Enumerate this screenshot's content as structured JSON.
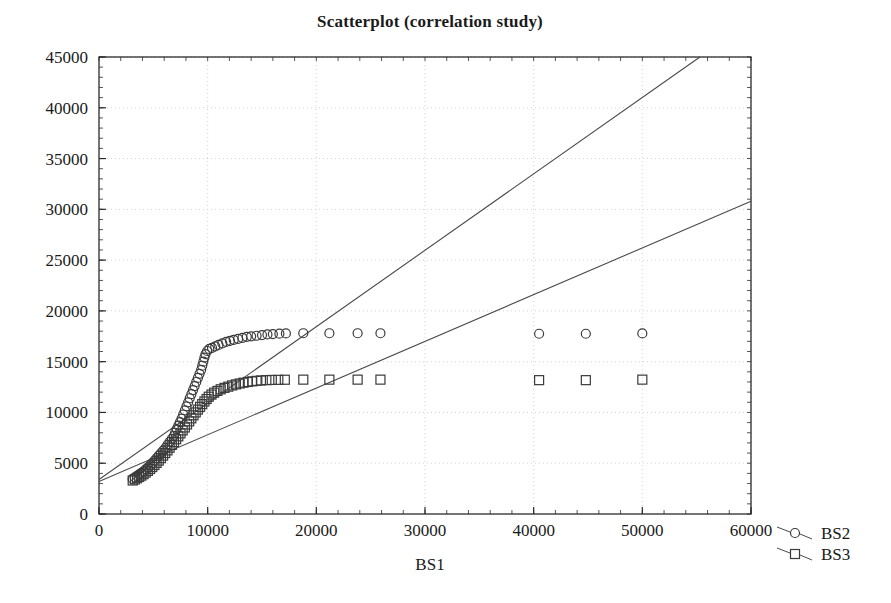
{
  "chart_data": {
    "type": "scatter",
    "title": "Scatterplot (correlation study)",
    "xlabel": "BS1",
    "ylabel": "",
    "xlim": [
      0,
      60000
    ],
    "ylim": [
      0,
      45000
    ],
    "xticks": [
      0,
      10000,
      20000,
      30000,
      40000,
      50000,
      60000
    ],
    "yticks": [
      0,
      5000,
      10000,
      15000,
      20000,
      25000,
      30000,
      35000,
      40000,
      45000
    ],
    "xtick_labels": [
      "0",
      "10000",
      "20000",
      "30000",
      "40000",
      "50000",
      "60000"
    ],
    "ytick_labels": [
      "0",
      "5000",
      "10000",
      "15000",
      "20000",
      "25000",
      "30000",
      "35000",
      "40000",
      "45000"
    ],
    "grid": true,
    "grid_style": "dotted",
    "legend_position": "outside-bottom-right",
    "minor_tick_step_x": 2000,
    "minor_tick_step_y": 1000,
    "marker_color": "#3a3a3a",
    "line_color": "#4a4a4a",
    "grid_color": "#c8c8cf",
    "axis_color": "#2b2b2b",
    "series": [
      {
        "name": "BS2",
        "marker": "circle",
        "points": [
          [
            3100,
            3450
          ],
          [
            3300,
            3600
          ],
          [
            3500,
            3750
          ],
          [
            3700,
            3900
          ],
          [
            3900,
            4050
          ],
          [
            4100,
            4200
          ],
          [
            4300,
            4400
          ],
          [
            4500,
            4600
          ],
          [
            4700,
            4800
          ],
          [
            4900,
            5000
          ],
          [
            5100,
            5250
          ],
          [
            5300,
            5500
          ],
          [
            5500,
            5750
          ],
          [
            5700,
            6000
          ],
          [
            5900,
            6250
          ],
          [
            6100,
            6500
          ],
          [
            6300,
            6800
          ],
          [
            6500,
            7100
          ],
          [
            6700,
            7400
          ],
          [
            6900,
            7700
          ],
          [
            7000,
            8000
          ],
          [
            7150,
            8350
          ],
          [
            7300,
            8700
          ],
          [
            7450,
            9050
          ],
          [
            7600,
            9400
          ],
          [
            7750,
            9800
          ],
          [
            7900,
            10200
          ],
          [
            8050,
            10600
          ],
          [
            8200,
            11000
          ],
          [
            8350,
            11400
          ],
          [
            8500,
            11800
          ],
          [
            8650,
            12200
          ],
          [
            8800,
            12600
          ],
          [
            8950,
            13000
          ],
          [
            9100,
            13400
          ],
          [
            9250,
            13800
          ],
          [
            9400,
            14200
          ],
          [
            9500,
            14600
          ],
          [
            9600,
            15000
          ],
          [
            9700,
            15400
          ],
          [
            9800,
            15750
          ],
          [
            9950,
            16050
          ],
          [
            10150,
            16250
          ],
          [
            10400,
            16350
          ],
          [
            10700,
            16500
          ],
          [
            11000,
            16650
          ],
          [
            11350,
            16800
          ],
          [
            11700,
            16950
          ],
          [
            12050,
            17050
          ],
          [
            12400,
            17150
          ],
          [
            12800,
            17250
          ],
          [
            13200,
            17350
          ],
          [
            13600,
            17450
          ],
          [
            14000,
            17500
          ],
          [
            14500,
            17550
          ],
          [
            15000,
            17620
          ],
          [
            15500,
            17680
          ],
          [
            16000,
            17720
          ],
          [
            16600,
            17760
          ],
          [
            17200,
            17780
          ],
          [
            18800,
            17800
          ],
          [
            21200,
            17800
          ],
          [
            23800,
            17800
          ],
          [
            25900,
            17800
          ],
          [
            40500,
            17750
          ],
          [
            44800,
            17750
          ],
          [
            50000,
            17780
          ]
        ]
      },
      {
        "name": "BS3",
        "marker": "square",
        "points": [
          [
            3100,
            3300
          ],
          [
            3300,
            3400
          ],
          [
            3500,
            3520
          ],
          [
            3700,
            3650
          ],
          [
            3900,
            3780
          ],
          [
            4100,
            3920
          ],
          [
            4300,
            4080
          ],
          [
            4500,
            4250
          ],
          [
            4700,
            4430
          ],
          [
            4900,
            4620
          ],
          [
            5100,
            4820
          ],
          [
            5300,
            5030
          ],
          [
            5500,
            5260
          ],
          [
            5700,
            5500
          ],
          [
            5900,
            5750
          ],
          [
            6100,
            6000
          ],
          [
            6300,
            6260
          ],
          [
            6500,
            6530
          ],
          [
            6700,
            6800
          ],
          [
            6900,
            7080
          ],
          [
            7100,
            7360
          ],
          [
            7300,
            7650
          ],
          [
            7500,
            7940
          ],
          [
            7700,
            8230
          ],
          [
            7900,
            8520
          ],
          [
            8100,
            8820
          ],
          [
            8300,
            9120
          ],
          [
            8500,
            9420
          ],
          [
            8700,
            9720
          ],
          [
            8900,
            10000
          ],
          [
            9100,
            10280
          ],
          [
            9300,
            10550
          ],
          [
            9500,
            10820
          ],
          [
            9700,
            11080
          ],
          [
            9900,
            11320
          ],
          [
            10100,
            11550
          ],
          [
            10350,
            11760
          ],
          [
            10600,
            11950
          ],
          [
            10900,
            12120
          ],
          [
            11200,
            12280
          ],
          [
            11550,
            12420
          ],
          [
            11900,
            12540
          ],
          [
            12250,
            12660
          ],
          [
            12600,
            12760
          ],
          [
            12950,
            12850
          ],
          [
            13300,
            12930
          ],
          [
            13700,
            13000
          ],
          [
            14100,
            13060
          ],
          [
            14500,
            13110
          ],
          [
            14900,
            13150
          ],
          [
            15400,
            13180
          ],
          [
            15900,
            13200
          ],
          [
            16500,
            13210
          ],
          [
            17100,
            13220
          ],
          [
            18800,
            13230
          ],
          [
            21200,
            13230
          ],
          [
            23800,
            13230
          ],
          [
            25900,
            13230
          ],
          [
            40500,
            13180
          ],
          [
            44800,
            13180
          ],
          [
            50000,
            13230
          ]
        ]
      }
    ],
    "trend_lines": [
      {
        "name": "BS2-fit",
        "x0": 0,
        "y0": 3400,
        "x1": 55300,
        "y1": 45000
      },
      {
        "name": "BS3-fit",
        "x0": 0,
        "y0": 3200,
        "x1": 60000,
        "y1": 30800
      }
    ],
    "legend": [
      {
        "label": "BS2",
        "marker": "circle"
      },
      {
        "label": "BS3",
        "marker": "square"
      }
    ]
  }
}
